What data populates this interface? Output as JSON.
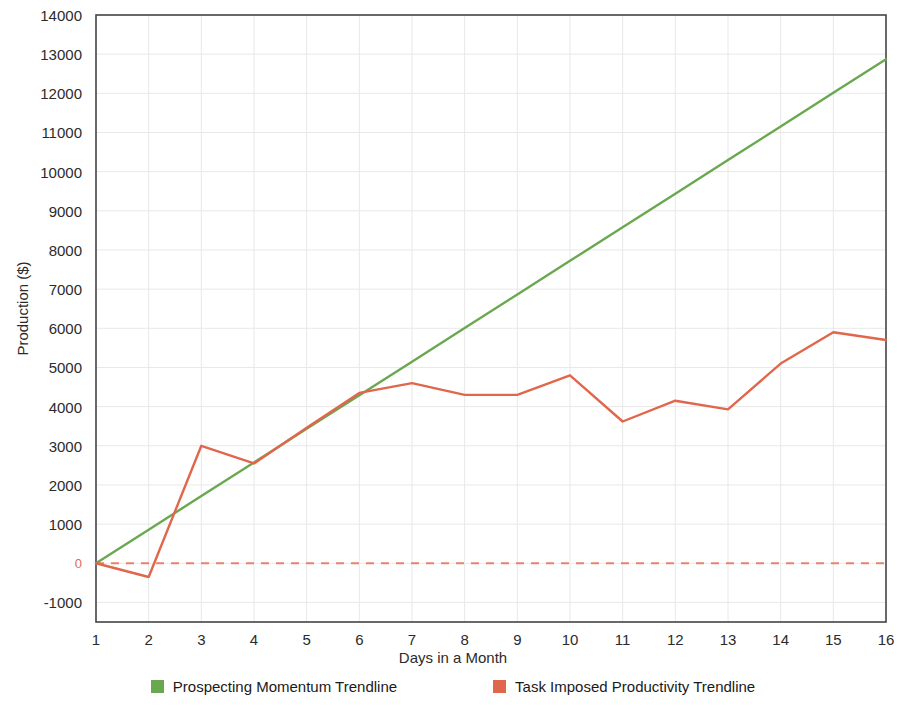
{
  "chart_data": {
    "type": "line",
    "title": "",
    "xlabel": "Days in a Month",
    "ylabel": "Production ($)",
    "x": [
      1,
      2,
      3,
      4,
      5,
      6,
      7,
      8,
      9,
      10,
      11,
      12,
      13,
      14,
      15,
      16
    ],
    "categories": [
      "1",
      "2",
      "3",
      "4",
      "5",
      "6",
      "7",
      "8",
      "9",
      "10",
      "11",
      "12",
      "13",
      "14",
      "15",
      "16"
    ],
    "xlim": [
      1,
      16
    ],
    "ylim": [
      -1500,
      14000
    ],
    "yticks": [
      14000,
      13000,
      12000,
      11000,
      10000,
      9000,
      8000,
      7000,
      6000,
      5000,
      4000,
      3000,
      2000,
      1000,
      0,
      -1000
    ],
    "ytick_labels": [
      "14000",
      "13000",
      "12000",
      "11000",
      "10000",
      "9000",
      "8000",
      "7000",
      "6000",
      "5000",
      "4000",
      "3000",
      "2000",
      "1000",
      "0",
      "-1000"
    ],
    "grid": true,
    "grid_color": "#e8e8e8",
    "zero_line": {
      "value": 0,
      "style": "dashed",
      "color": "#e8836d"
    },
    "legend_position": "bottom",
    "series": [
      {
        "name": "Prospecting Momentum Trendline",
        "color": "#6aa84f",
        "type": "line",
        "values": [
          0,
          858,
          1716,
          2574,
          3432,
          4290,
          5148,
          6006,
          6864,
          7722,
          8580,
          9438,
          10296,
          11154,
          12012,
          12870
        ]
      },
      {
        "name": "Task Imposed Productivity Trendline",
        "color": "#e0674c",
        "type": "line",
        "values": [
          0,
          -350,
          3000,
          2550,
          3460,
          4350,
          4600,
          4300,
          4300,
          4800,
          3620,
          4150,
          3930,
          5100,
          5900,
          5700
        ]
      }
    ]
  },
  "axes": {
    "y_title": "Production ($)",
    "x_title": "Days in a Month"
  },
  "legend": {
    "items": [
      {
        "label": "Prospecting Momentum Trendline",
        "color": "#6aa84f"
      },
      {
        "label": "Task Imposed Productivity Trendline",
        "color": "#e0674c"
      }
    ]
  }
}
